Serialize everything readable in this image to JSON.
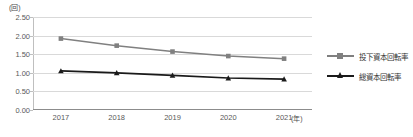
{
  "chart_data": {
    "type": "line",
    "title": "",
    "xlabel": "(年)",
    "ylabel": "(回)",
    "categories": [
      "2017",
      "2018",
      "2019",
      "2020",
      "2021"
    ],
    "ylim": [
      0.0,
      2.5
    ],
    "ytick_labels": [
      "0.00",
      "0.50",
      "1.00",
      "1.50",
      "2.00",
      "2.50"
    ],
    "ytick_values": [
      0.0,
      0.5,
      1.0,
      1.5,
      2.0,
      2.5
    ],
    "grid": true,
    "legend_position": "right",
    "series": [
      {
        "name": "投下資本回転率",
        "values": [
          1.92,
          1.73,
          1.57,
          1.45,
          1.38
        ],
        "color": "#808080",
        "marker": "square"
      },
      {
        "name": "総資本回転率",
        "values": [
          1.05,
          1.0,
          0.93,
          0.86,
          0.83
        ],
        "color": "#1a1a1a",
        "marker": "triangle"
      }
    ]
  },
  "axis": {
    "y_unit": "(回)",
    "x_unit": "(年)"
  },
  "colors": {
    "series_1": "#808080",
    "series_2": "#1a1a1a",
    "gridline": "#d9d9d9",
    "axis": "#bfbfbf",
    "baseline": "#8c8c8c",
    "text": "#595959"
  }
}
